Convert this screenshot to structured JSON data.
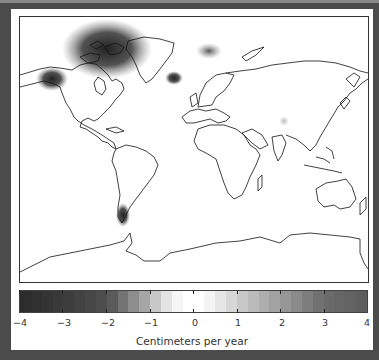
{
  "chart_data": {
    "type": "heatmap",
    "title": "",
    "colorbar": {
      "label": "Centimeters per year",
      "min": -4,
      "max": 4,
      "ticks": [
        -4,
        -3,
        -2,
        -1,
        0,
        1,
        2,
        3,
        4
      ],
      "tick_labels": [
        "−4",
        "−3",
        "−2",
        "−1",
        "0",
        "1",
        "2",
        "3",
        "4"
      ],
      "colormap": "grayscale diverging: dark (negative) → white (0) → gray (positive)",
      "segments": [
        "#2c2c2c",
        "#303030",
        "#343434",
        "#393939",
        "#3d3d3d",
        "#424242",
        "#474747",
        "#4d4d4d",
        "#5a5a5a",
        "#747474",
        "#8d8d8d",
        "#a6a6a6",
        "#c8c8c8",
        "#e4e4e4",
        "#f6f6f6",
        "#ffffff",
        "#ffffff",
        "#f4f4f4",
        "#e6e6e6",
        "#d7d7d7",
        "#c8c8c8",
        "#bbbbbb",
        "#aeaeae",
        "#a2a2a2",
        "#969696",
        "#8a8a8a",
        "#7d7d7d",
        "#717171",
        "#6a6a6a",
        "#666666",
        "#626262",
        "#5e5e5e"
      ]
    },
    "hotspots": [
      {
        "region": "Canadian Arctic Archipelago",
        "approx_value": -4
      },
      {
        "region": "Alaska (Gulf of Alaska coast)",
        "approx_value": -4
      },
      {
        "region": "Iceland",
        "approx_value": -3
      },
      {
        "region": "Svalbard",
        "approx_value": -2
      },
      {
        "region": "Patagonia",
        "approx_value": -4
      },
      {
        "region": "Central Asia (Tibet)",
        "approx_value": -1
      },
      {
        "region": "Antarctic Peninsula",
        "approx_value": -1
      }
    ],
    "grid": false,
    "legend_position": "bottom"
  }
}
